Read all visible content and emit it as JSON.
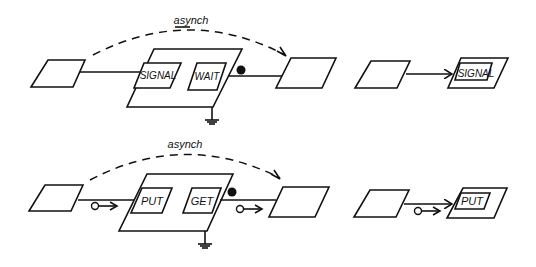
{
  "diagram": {
    "top_row": {
      "async_label": "asynch",
      "left_box": {
        "label": ""
      },
      "process": {
        "inner_left": "SIGNAL",
        "inner_right": "WAIT"
      },
      "right_box": {
        "label": ""
      },
      "shorthand": {
        "source_box": {
          "label": ""
        },
        "target_inner": "SIGNAL"
      }
    },
    "bottom_row": {
      "async_label": "asynch",
      "left_box": {
        "label": ""
      },
      "process": {
        "inner_left": "PUT",
        "inner_right": "GET"
      },
      "right_box": {
        "label": ""
      },
      "shorthand": {
        "source_box": {
          "label": ""
        },
        "target_inner": "PUT"
      }
    }
  }
}
